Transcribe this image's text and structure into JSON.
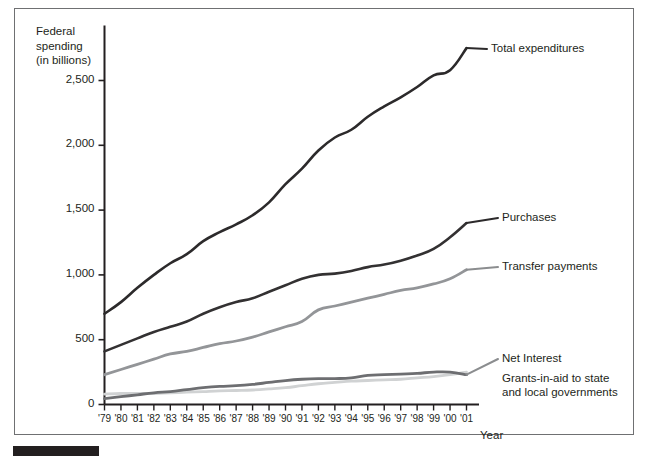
{
  "figure": {
    "background_color": "#ffffff",
    "frame_color": "#6f7072",
    "bottom_bar_color": "#231f20"
  },
  "chart_data": {
    "type": "line",
    "title": "",
    "xlabel": "Year",
    "ylabel": "Federal spending\n(in billions)",
    "ylabel_line1": "Federal",
    "ylabel_line2": "spending",
    "ylabel_line3": "(in billions)",
    "grid": false,
    "legend_position": "right-inline-labels",
    "xlim": [
      "'79",
      "'01"
    ],
    "ylim": [
      0,
      2750
    ],
    "ytick_values": [
      0,
      500,
      1000,
      1500,
      2000,
      2500
    ],
    "ytick_labels": [
      "0",
      "500",
      "1,000",
      "1,500",
      "2,000",
      "2,500"
    ],
    "x": [
      "'79",
      "'80",
      "'81",
      "'82",
      "'83",
      "'84",
      "'85",
      "'86",
      "'87",
      "'88",
      "'89",
      "'90",
      "'91",
      "'92",
      "'93",
      "'94",
      "'95",
      "'96",
      "'97",
      "'98",
      "'99",
      "'00",
      "'01"
    ],
    "xtick_labels": [
      "'79",
      "'80",
      "'81",
      "'82",
      "'83",
      "'84",
      "'85",
      "'86",
      "'87",
      "'88",
      "'89",
      "'90",
      "'91",
      "'92",
      "'93",
      "'94",
      "'95",
      "'96",
      "'97",
      "'98",
      "'99",
      "'00",
      "'01"
    ],
    "series": [
      {
        "name": "Total expenditures",
        "color": "#2c2a2b",
        "width": 2.6,
        "label_x": "'01",
        "values": [
          700,
          790,
          900,
          1000,
          1090,
          1160,
          1260,
          1330,
          1390,
          1460,
          1560,
          1700,
          1820,
          1960,
          2060,
          2120,
          2220,
          2300,
          2370,
          2450,
          2540,
          2580,
          2750
        ]
      },
      {
        "name": "Purchases",
        "color": "#333132",
        "width": 2.6,
        "label_x": "'01",
        "values": [
          410,
          460,
          510,
          560,
          600,
          640,
          700,
          750,
          790,
          820,
          870,
          920,
          970,
          1000,
          1010,
          1030,
          1060,
          1080,
          1110,
          1150,
          1200,
          1290,
          1400
        ]
      },
      {
        "name": "Transfer payments",
        "color": "#939598",
        "width": 2.8,
        "label_x": "'01",
        "values": [
          230,
          270,
          310,
          350,
          390,
          410,
          440,
          470,
          490,
          520,
          560,
          600,
          640,
          730,
          760,
          790,
          820,
          850,
          880,
          900,
          930,
          970,
          1040
        ]
      },
      {
        "name": "Net Interest",
        "color": "#6d6e71",
        "width": 2.8,
        "label_x": "'01",
        "values": [
          45,
          60,
          75,
          90,
          100,
          115,
          130,
          140,
          145,
          155,
          170,
          185,
          195,
          200,
          200,
          205,
          225,
          230,
          235,
          240,
          250,
          250,
          230
        ]
      },
      {
        "name": "Grants-in-aid to state and local governments",
        "label_line1": "Grants-in-aid to state",
        "label_line2": "and local governments",
        "color": "#d0d2d3",
        "width": 2.8,
        "label_x": "'01",
        "values": [
          80,
          85,
          85,
          85,
          90,
          95,
          100,
          105,
          108,
          112,
          120,
          130,
          145,
          160,
          170,
          180,
          185,
          190,
          195,
          205,
          215,
          230,
          250
        ]
      }
    ],
    "annotations": [
      {
        "text": "Total expenditures",
        "series": "Total expenditures"
      },
      {
        "text": "Purchases",
        "series": "Purchases"
      },
      {
        "text": "Transfer payments",
        "series": "Transfer payments"
      },
      {
        "text": "Net Interest",
        "series": "Net Interest"
      },
      {
        "text": "Grants-in-aid to state and local governments",
        "series": "Grants-in-aid to state and local governments"
      }
    ]
  }
}
